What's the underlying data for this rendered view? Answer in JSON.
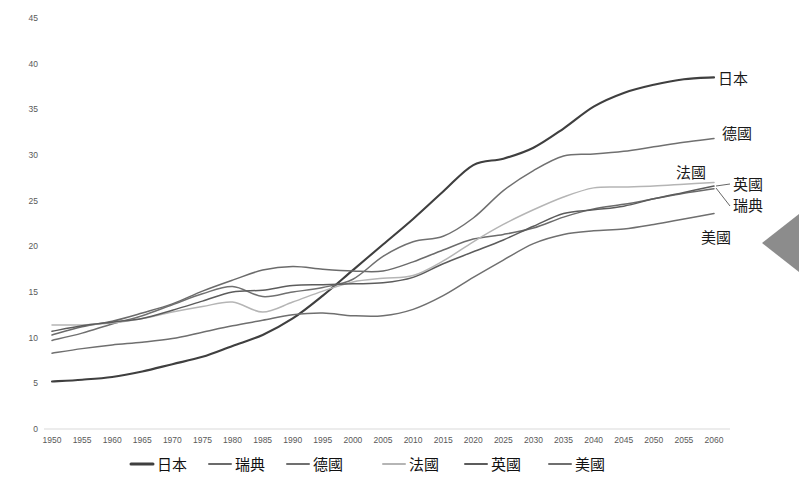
{
  "chart_data": {
    "type": "line",
    "title": "",
    "xlabel": "",
    "ylabel": "",
    "xlim": [
      1950,
      2060
    ],
    "ylim": [
      0,
      45
    ],
    "ytick_step": 5,
    "xtick_step": 5,
    "grid": false,
    "legend_position": "bottom",
    "x": [
      1950,
      1955,
      1960,
      1965,
      1970,
      1975,
      1980,
      1985,
      1990,
      1995,
      2000,
      2005,
      2010,
      2015,
      2020,
      2025,
      2030,
      2035,
      2040,
      2045,
      2050,
      2055,
      2060
    ],
    "yticks": [
      0,
      5,
      10,
      15,
      20,
      25,
      30,
      35,
      40,
      45
    ],
    "xticks": [
      1950,
      1955,
      1960,
      1965,
      1970,
      1975,
      1980,
      1985,
      1990,
      1995,
      2000,
      2005,
      2010,
      2015,
      2020,
      2025,
      2030,
      2035,
      2040,
      2045,
      2050,
      2055,
      2060
    ],
    "series": [
      {
        "name": "日本",
        "label_right": "日本",
        "color": "#3f3f3f",
        "width": 2.1,
        "values": [
          5.2,
          5.4,
          5.7,
          6.3,
          7.1,
          7.9,
          9.1,
          10.3,
          12.1,
          14.6,
          17.4,
          20.2,
          23.0,
          26.0,
          28.9,
          29.6,
          30.8,
          32.9,
          35.3,
          36.8,
          37.7,
          38.3,
          38.5
        ]
      },
      {
        "name": "瑞典",
        "label_right": "瑞典",
        "color": "#6b6b6b",
        "width": 1.5,
        "values": [
          10.3,
          11.2,
          11.8,
          12.7,
          13.7,
          15.1,
          16.3,
          17.4,
          17.8,
          17.5,
          17.3,
          17.3,
          18.3,
          19.6,
          20.8,
          21.3,
          22.0,
          23.2,
          24.1,
          24.6,
          25.2,
          25.8,
          26.3
        ]
      },
      {
        "name": "德國",
        "label_right": "德國",
        "color": "#707070",
        "width": 1.5,
        "values": [
          9.7,
          10.5,
          11.5,
          12.4,
          13.6,
          14.8,
          15.6,
          14.5,
          15.0,
          15.5,
          16.4,
          18.9,
          20.5,
          21.1,
          23.1,
          26.1,
          28.3,
          29.9,
          30.1,
          30.4,
          30.9,
          31.4,
          31.8
        ]
      },
      {
        "name": "法國",
        "label_right": "法國",
        "color": "#b5b5b5",
        "width": 1.5,
        "values": [
          11.4,
          11.4,
          11.6,
          12.1,
          12.8,
          13.4,
          13.9,
          12.8,
          13.9,
          15.1,
          16.1,
          16.5,
          16.8,
          18.4,
          20.5,
          22.4,
          24.0,
          25.4,
          26.4,
          26.5,
          26.6,
          26.8,
          27.0
        ]
      },
      {
        "name": "英國",
        "label_right": "英國",
        "color": "#5c5c5c",
        "width": 1.5,
        "values": [
          10.7,
          11.3,
          11.7,
          12.1,
          13.0,
          14.0,
          15.0,
          15.2,
          15.7,
          15.8,
          15.9,
          16.0,
          16.6,
          18.1,
          19.4,
          20.7,
          22.2,
          23.6,
          24.0,
          24.4,
          25.2,
          25.9,
          26.6
        ]
      },
      {
        "name": "美國",
        "label_right": "美國",
        "color": "#6f6f6f",
        "width": 1.5,
        "values": [
          8.3,
          8.8,
          9.2,
          9.5,
          9.9,
          10.6,
          11.3,
          11.9,
          12.5,
          12.7,
          12.4,
          12.4,
          13.1,
          14.6,
          16.6,
          18.5,
          20.3,
          21.3,
          21.7,
          21.9,
          22.4,
          23.0,
          23.6
        ]
      }
    ],
    "legend": [
      {
        "label": "日本",
        "color": "#3f3f3f",
        "width": 3.0
      },
      {
        "label": "瑞典",
        "color": "#6b6b6b",
        "width": 2.0
      },
      {
        "label": "德國",
        "color": "#707070",
        "width": 2.0
      },
      {
        "label": "法國",
        "color": "#b5b5b5",
        "width": 2.0
      },
      {
        "label": "英國",
        "color": "#5c5c5c",
        "width": 2.0
      },
      {
        "label": "美國",
        "color": "#6f6f6f",
        "width": 2.0
      }
    ],
    "right_labels": [
      {
        "text": "日本",
        "x": 718,
        "y": 84
      },
      {
        "text": "德國",
        "x": 722,
        "y": 139
      },
      {
        "text": "法國",
        "x": 676,
        "y": 178
      },
      {
        "text": "英國",
        "x": 733,
        "y": 190
      },
      {
        "text": "瑞典",
        "x": 733,
        "y": 211
      },
      {
        "text": "美國",
        "x": 701,
        "y": 243
      }
    ],
    "decoration": {
      "arrow_name": "right-edge-arrow",
      "arrow_color": "#8c8c8c"
    }
  }
}
